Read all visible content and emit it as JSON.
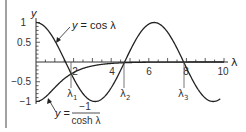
{
  "chart_data": {
    "type": "line",
    "title": "",
    "xlabel": "λ",
    "ylabel": "y",
    "xlim": [
      0,
      10.5
    ],
    "ylim": [
      -1.1,
      1.1
    ],
    "grid": false,
    "x_ticks": [
      "2",
      "4",
      "6",
      "8",
      "10"
    ],
    "y_ticks": [
      "1",
      "0.5",
      "−0.5",
      "−1"
    ],
    "series": [
      {
        "name": "y = cos λ",
        "function": "cos(λ)",
        "x_range": [
          0,
          9.8
        ]
      },
      {
        "name": "y = −1 / cosh λ",
        "function": "-1/cosh(λ)",
        "x_range": [
          0,
          10
        ]
      }
    ],
    "intersections": [
      {
        "label": "λ₁",
        "x": 1.875
      },
      {
        "label": "λ₂",
        "x": 4.694
      },
      {
        "label": "λ₃",
        "x": 7.855
      }
    ],
    "annotations": [
      {
        "text": "y = cos λ",
        "points_to": "cos curve near λ≈1.2"
      },
      {
        "text": "y = −1 / cosh λ",
        "points_to": "-1/cosh curve near λ≈0.8"
      }
    ]
  },
  "labels": {
    "y_axis": "y",
    "x_axis": "λ",
    "cos_label": "y = cos λ",
    "cosh_y": "y =",
    "cosh_num": "−1",
    "cosh_den": "cosh λ",
    "lambda1": "λ",
    "lambda1_sub": "1",
    "lambda2": "λ",
    "lambda2_sub": "2",
    "lambda3": "λ",
    "lambda3_sub": "3",
    "tick_x_2": "2",
    "tick_x_4": "4",
    "tick_x_6": "6",
    "tick_x_8": "8",
    "tick_x_10": "10",
    "tick_y_1": "1",
    "tick_y_05": "0.5",
    "tick_y_m05": "−0.5",
    "tick_y_m1": "−1"
  },
  "colors": {
    "curve": "#222222",
    "axis": "#333333",
    "background": "#ffffff"
  }
}
